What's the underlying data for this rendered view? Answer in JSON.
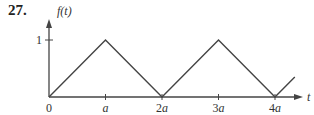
{
  "problem_number": "27.",
  "chart_data": {
    "type": "line",
    "title": "",
    "xlabel": "t",
    "ylabel": "f(t)",
    "x_tick_labels": [
      "0",
      "a",
      "2a",
      "3a",
      "4a"
    ],
    "x_tick_values": [
      0,
      1,
      2,
      3,
      4
    ],
    "y_tick_labels": [
      "1"
    ],
    "y_tick_values": [
      1
    ],
    "xlim": [
      0,
      4.4
    ],
    "ylim": [
      0,
      1.3
    ],
    "grid": false,
    "x_unit": "a",
    "series": [
      {
        "name": "f(t)",
        "x": [
          0,
          1,
          2,
          3,
          4,
          4.35
        ],
        "y": [
          0,
          1,
          0,
          1,
          0,
          0.35
        ]
      }
    ],
    "colors": {
      "curve": "#444444",
      "axis": "#444444",
      "text": "#333333"
    }
  }
}
